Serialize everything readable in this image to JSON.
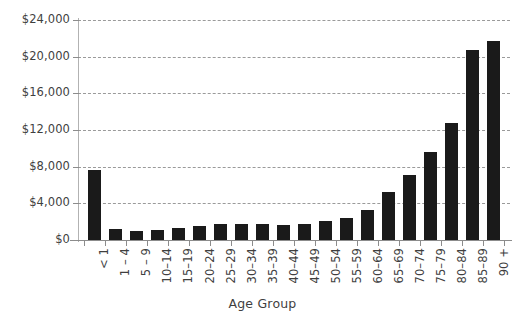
{
  "chart_data": {
    "type": "bar",
    "title": "",
    "xlabel": "Age Group",
    "ylabel": "",
    "categories": [
      "< 1",
      "1 – 4",
      "5 – 9",
      "10–14",
      "15–19",
      "20–24",
      "25–29",
      "30–34",
      "35–39",
      "40–44",
      "45–49",
      "50–54",
      "55–59",
      "60–64",
      "65–69",
      "70–74",
      "75–79",
      "80–84",
      "85–89",
      "90 +"
    ],
    "values": [
      7600,
      1200,
      950,
      1050,
      1300,
      1500,
      1700,
      1800,
      1750,
      1650,
      1700,
      2100,
      2400,
      3300,
      5200,
      7100,
      9600,
      12800,
      20700,
      21700
    ],
    "ylim": [
      0,
      24000
    ],
    "ytick_values": [
      0,
      4000,
      8000,
      12000,
      16000,
      20000,
      24000
    ],
    "ytick_labels": [
      "$0",
      "$4,000",
      "$8,000",
      "$12,000",
      "$16,000",
      "$20,000",
      "$24,000"
    ],
    "grid": true,
    "grid_style": "dashed-horizontal",
    "legend": false,
    "bar_color": "#1a1a1a",
    "grid_color": "#9a9a9a",
    "axis_color": "#8c8c8c",
    "text_color": "#3f3f3f",
    "background_color": "#ffffff"
  }
}
